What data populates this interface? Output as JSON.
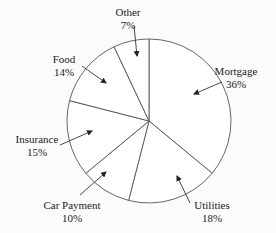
{
  "chart_data": {
    "type": "pie",
    "title": "",
    "start_angle_deg": 0,
    "direction": "clockwise",
    "slices": [
      {
        "label": "Mortgage",
        "value": 36,
        "pct_label": "36%"
      },
      {
        "label": "Utilities",
        "value": 18,
        "pct_label": "18%"
      },
      {
        "label": "Car Payment",
        "value": 10,
        "pct_label": "10%"
      },
      {
        "label": "Insurance",
        "value": 15,
        "pct_label": "15%"
      },
      {
        "label": "Food",
        "value": 14,
        "pct_label": "14%"
      },
      {
        "label": "Other",
        "value": 7,
        "pct_label": "7%"
      }
    ],
    "labels_with_arrows": true,
    "fill_color": "#ffffff",
    "stroke_color": "#555555"
  },
  "labels": {
    "mortgage": {
      "name": "Mortgage",
      "pct": "36%"
    },
    "utilities": {
      "name": "Utilities",
      "pct": "18%"
    },
    "car_payment": {
      "name": "Car Payment",
      "pct": "10%"
    },
    "insurance": {
      "name": "Insurance",
      "pct": "15%"
    },
    "food": {
      "name": "Food",
      "pct": "14%"
    },
    "other": {
      "name": "Other",
      "pct": "7%"
    }
  }
}
